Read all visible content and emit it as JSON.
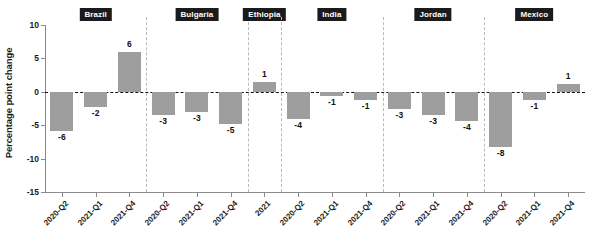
{
  "chart_data": {
    "type": "bar",
    "title": "",
    "subtitle": "",
    "xlabel": "",
    "ylabel": "Percentage point change",
    "ylim": [
      -15,
      10
    ],
    "yticks": [
      10,
      5,
      0,
      -5,
      -10,
      -15
    ],
    "ytick_labels": [
      "10",
      "5",
      "0",
      "-5",
      "-10",
      "-15"
    ],
    "grid": false,
    "zero_reference_line": true,
    "legend": "none",
    "bar_color": "#9e9e9e",
    "panel_label_bg": "#1b1b1b",
    "panel_label_color": "#ffffff",
    "panels": [
      {
        "name": "Brazil",
        "categories": [
          "2020-Q2",
          "2021-Q1",
          "2021-Q4"
        ],
        "values": [
          -5.8,
          -2.3,
          6.0
        ],
        "labels": [
          "-6",
          "-2",
          "6"
        ]
      },
      {
        "name": "Bulgaria",
        "categories": [
          "2020-Q2",
          "2021-Q1",
          "2021-Q4"
        ],
        "values": [
          -3.5,
          -3.0,
          -4.8
        ],
        "labels": [
          "-3",
          "-3",
          "-5"
        ]
      },
      {
        "name": "Ethiopia",
        "categories": [
          "2021"
        ],
        "values": [
          1.4
        ],
        "labels": [
          "1"
        ]
      },
      {
        "name": "India",
        "categories": [
          "2020-Q2",
          "2021-Q1",
          "2021-Q4"
        ],
        "values": [
          -4.0,
          -0.6,
          -1.3
        ],
        "labels": [
          "-4",
          "-1",
          "-1"
        ]
      },
      {
        "name": "Jordan",
        "categories": [
          "2020-Q2",
          "2021-Q1",
          "2021-Q4"
        ],
        "values": [
          -2.6,
          -3.4,
          -4.3
        ],
        "labels": [
          "-3",
          "-3",
          "-4"
        ]
      },
      {
        "name": "Mexico",
        "categories": [
          "2020-Q2",
          "2021-Q1",
          "2021-Q4"
        ],
        "values": [
          -8.3,
          -1.2,
          1.2
        ],
        "labels": [
          "-8",
          "-1",
          "1"
        ]
      }
    ]
  }
}
